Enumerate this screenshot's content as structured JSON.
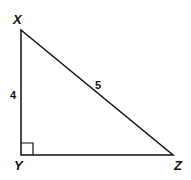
{
  "diagram": {
    "type": "right-triangle",
    "vertices": {
      "X": {
        "label": "X",
        "x": 21,
        "y": 30
      },
      "Y": {
        "label": "Y",
        "x": 21,
        "y": 155
      },
      "Z": {
        "label": "Z",
        "x": 173,
        "y": 155
      }
    },
    "sides": {
      "XY": {
        "label": "4"
      },
      "XZ": {
        "label": "5"
      }
    },
    "right_angle_at": "Y",
    "line_color": "#111111"
  }
}
